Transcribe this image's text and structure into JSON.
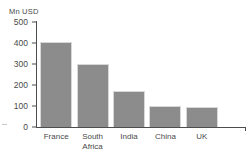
{
  "chart_data": {
    "type": "bar",
    "title": "",
    "subtitle": "",
    "xlabel": "",
    "ylabel": "Mn USD",
    "ylim": [
      0,
      500
    ],
    "yticks": [
      0,
      100,
      200,
      300,
      400,
      500
    ],
    "ytick_labels": [
      "0",
      "100",
      "200",
      "300",
      "400",
      "500"
    ],
    "grid": false,
    "legend": false,
    "legend_position": "none",
    "categories": [
      "France",
      "South\nAfrica",
      "India",
      "China",
      "UK"
    ],
    "category_labels": [
      "France",
      "South Africa",
      "India",
      "China",
      "UK"
    ],
    "values": [
      405,
      300,
      173,
      100,
      95
    ],
    "bar_color": "#8c8c8c",
    "bar_border_color": "#d8d8d8",
    "axis_color": "#4d4d4d",
    "text_color": "#4a4a4a",
    "background_color": "#ffffff"
  }
}
